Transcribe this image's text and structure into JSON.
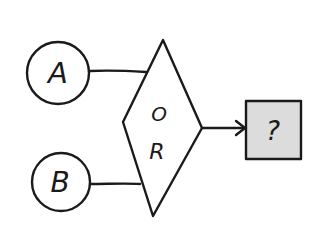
{
  "diagram": {
    "type": "logic-gate-flow",
    "inputs": [
      {
        "id": "A",
        "label": "A",
        "shape": "circle"
      },
      {
        "id": "B",
        "label": "B",
        "shape": "circle"
      }
    ],
    "gate": {
      "shape": "diamond",
      "label_line1": "O",
      "label_line2": "R"
    },
    "output": {
      "shape": "box",
      "label": "?",
      "fill": "#dcdcdc"
    },
    "edges": [
      {
        "from": "A",
        "to": "gate",
        "arrow": false
      },
      {
        "from": "B",
        "to": "gate",
        "arrow": false
      },
      {
        "from": "gate",
        "to": "output",
        "arrow": true
      }
    ],
    "colors": {
      "stroke": "#1a1a1a",
      "background": "#ffffff",
      "output_fill": "#dcdcdc"
    }
  }
}
